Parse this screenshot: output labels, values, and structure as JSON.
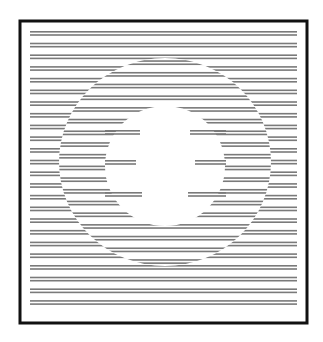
{
  "image": {
    "description": "Optical illusion: horizontal line pairs in a square frame with a phase-shifted elliptical annulus and a white central figure",
    "background": "#ffffff",
    "line_color": "#7a7a7a",
    "frame_color": "#111111"
  },
  "frame": {
    "x": 20,
    "y": 21,
    "width": 287,
    "height": 302,
    "stroke": 3
  },
  "lines": {
    "x_start": 30,
    "x_end": 297,
    "thickness": 1.6,
    "first_y": 31,
    "pair_gap": 3.2,
    "period": 11.7,
    "count": 24,
    "inner_phase_shift": 5.85
  },
  "ellipse": {
    "cx": 165,
    "cy": 162,
    "rx": 106,
    "ry": 104
  },
  "center_figure": {
    "circle": {
      "cx": 165,
      "cy": 166,
      "r": 60
    },
    "intrusions": [
      {
        "x1": 105,
        "x2": 140,
        "y": 130
      },
      {
        "x1": 190,
        "x2": 226,
        "y": 130
      },
      {
        "x1": 105,
        "x2": 136,
        "y": 160
      },
      {
        "x1": 195,
        "x2": 226,
        "y": 160
      },
      {
        "x1": 105,
        "x2": 142,
        "y": 192
      },
      {
        "x1": 188,
        "x2": 226,
        "y": 192
      }
    ]
  }
}
